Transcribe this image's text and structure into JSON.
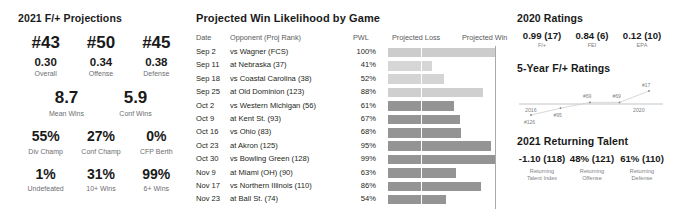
{
  "left": {
    "title": "2021 F/+ Projections",
    "ranks": [
      {
        "rank": "#43",
        "value": "0.30",
        "label": "Overall"
      },
      {
        "rank": "#50",
        "value": "0.34",
        "label": "Offense"
      },
      {
        "rank": "#45",
        "value": "0.38",
        "label": "Defense"
      }
    ],
    "wins": [
      {
        "value": "8.7",
        "label": "Mean Wins"
      },
      {
        "value": "5.9",
        "label": "Conf Wins"
      }
    ],
    "probs_row1": [
      {
        "value": "55%",
        "label": "Div Champ"
      },
      {
        "value": "27%",
        "label": "Conf Champ"
      },
      {
        "value": "0%",
        "label": "CFP Berth"
      }
    ],
    "probs_row2": [
      {
        "value": "1%",
        "label": "Undefeated"
      },
      {
        "value": "31%",
        "label": "10+ Wins"
      },
      {
        "value": "99%",
        "label": "6+ Wins"
      }
    ]
  },
  "middle": {
    "title": "Projected Win Likelihood by Game",
    "headers": {
      "date": "Date",
      "opponent": "Opponent (Proj Rank)",
      "pwl": "PWL",
      "loss": "Projected Loss",
      "win": "Projected Win"
    },
    "rows": [
      {
        "date": "Sep 2",
        "opponent": "vs Wagner (FCS)",
        "pwl": "100%",
        "pwl_value": 100,
        "shade": "#cccccc"
      },
      {
        "date": "Sep 11",
        "opponent": "at Nebraska (37)",
        "pwl": "41%",
        "pwl_value": 41,
        "shade": "#d6d6d6"
      },
      {
        "date": "Sep 18",
        "opponent": "vs Coastal Carolina (38)",
        "pwl": "52%",
        "pwl_value": 52,
        "shade": "#d4d4d4"
      },
      {
        "date": "Sep 25",
        "opponent": "at Old Dominion (123)",
        "pwl": "88%",
        "pwl_value": 88,
        "shade": "#cfcfcf"
      },
      {
        "date": "Oct 2",
        "opponent": "vs Western Michigan (56)",
        "pwl": "61%",
        "pwl_value": 61,
        "shade": "#949494"
      },
      {
        "date": "Oct 9",
        "opponent": "at Kent St. (93)",
        "pwl": "67%",
        "pwl_value": 67,
        "shade": "#949494"
      },
      {
        "date": "Oct 16",
        "opponent": "vs Ohio (83)",
        "pwl": "68%",
        "pwl_value": 68,
        "shade": "#949494"
      },
      {
        "date": "Oct 23",
        "opponent": "at Akron (125)",
        "pwl": "95%",
        "pwl_value": 95,
        "shade": "#949494"
      },
      {
        "date": "Oct 30",
        "opponent": "vs Bowling Green (128)",
        "pwl": "99%",
        "pwl_value": 99,
        "shade": "#949494"
      },
      {
        "date": "Nov 9",
        "opponent": "at Miami (OH) (90)",
        "pwl": "63%",
        "pwl_value": 63,
        "shade": "#949494"
      },
      {
        "date": "Nov 17",
        "opponent": "vs Northern Illinois (110)",
        "pwl": "86%",
        "pwl_value": 86,
        "shade": "#949494"
      },
      {
        "date": "Nov 23",
        "opponent": "at Ball St. (74)",
        "pwl": "54%",
        "pwl_value": 54,
        "shade": "#949494"
      }
    ]
  },
  "right": {
    "ratings_title": "2020 Ratings",
    "ratings": [
      {
        "value": "0.99 (17)",
        "label": "F/+"
      },
      {
        "value": "0.84 (6)",
        "label": "FEI"
      },
      {
        "value": "0.12 (10)",
        "label": "EPA"
      }
    ],
    "five_year_title": "5-Year F/+ Ratings",
    "talent_title": "2021 Returning Talent",
    "talent": [
      {
        "value": "-1.10 (118)",
        "label1": "Returning",
        "label2": "Talent Index"
      },
      {
        "value": "48% (121)",
        "label1": "Returning",
        "label2": "Offense"
      },
      {
        "value": "61% (110)",
        "label1": "Returning",
        "label2": "Defense"
      }
    ]
  },
  "chart_data": [
    {
      "type": "bar",
      "title": "Projected Win Likelihood by Game",
      "xlabel": "",
      "ylabel": "",
      "categories": [
        "Sep 2 vs Wagner (FCS)",
        "Sep 11 at Nebraska (37)",
        "Sep 18 vs Coastal Carolina (38)",
        "Sep 25 at Old Dominion (123)",
        "Oct 2 vs Western Michigan (56)",
        "Oct 9 at Kent St. (93)",
        "Oct 16 vs Ohio (83)",
        "Oct 23 at Akron (125)",
        "Oct 30 vs Bowling Green (128)",
        "Nov 9 at Miami (OH) (90)",
        "Nov 17 vs Northern Illinois (110)",
        "Nov 23 at Ball St. (74)"
      ],
      "values": [
        100,
        41,
        52,
        88,
        61,
        67,
        68,
        95,
        99,
        63,
        86,
        54
      ],
      "ylim": [
        0,
        100
      ],
      "grid": false,
      "legend": [
        "Projected Loss",
        "Projected Win"
      ]
    },
    {
      "type": "line",
      "title": "5-Year F/+ Ratings",
      "x": [
        "2016",
        "2017",
        "2018",
        "2019",
        "2020"
      ],
      "point_labels": [
        "#126",
        "#95",
        "#69",
        "#69",
        "#17"
      ],
      "values": [
        126,
        95,
        69,
        69,
        17
      ],
      "xlabel": "",
      "ylabel": "F/+ Rank",
      "axis_start_label": "2016",
      "axis_end_label": "2020",
      "grid": false
    }
  ]
}
